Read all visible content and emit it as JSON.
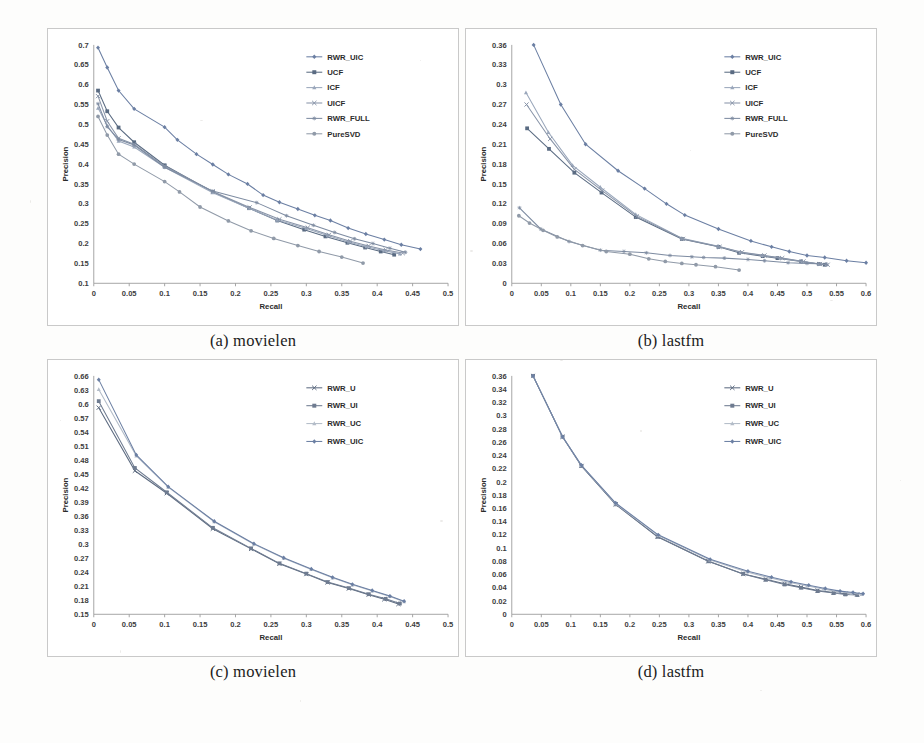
{
  "figure": {
    "panels": [
      {
        "id": "a",
        "caption": "(a) movielen",
        "chart_ref": 0
      },
      {
        "id": "b",
        "caption": "(b) lastfm",
        "chart_ref": 1
      },
      {
        "id": "c",
        "caption": "(c) movielen",
        "chart_ref": 2
      },
      {
        "id": "d",
        "caption": "(d) lastfm",
        "chart_ref": 3
      }
    ]
  },
  "colors": {
    "series_rwr_uic": "#6b7fa3",
    "series_ucf": "#5a6b82",
    "series_icf": "#9aa7bb",
    "series_uicf": "#8894a8",
    "series_rwr_full": "#7d8ba1",
    "series_puresvd": "#909aa8",
    "series_rwr_u": "#5d6b80",
    "series_rwr_ui": "#6e7b90",
    "series_rwr_uc": "#b3bcc8",
    "axis": "#9c9c9c",
    "text": "#2b2b2b",
    "panel_border": "#c9c9c9",
    "background": "#fdfdfc"
  },
  "chart_data": [
    {
      "type": "line",
      "title": "",
      "xlabel": "Recall",
      "ylabel": "Precision",
      "xlim": [
        0,
        0.5
      ],
      "ylim": [
        0.1,
        0.7
      ],
      "xticks": [
        "0",
        "0.05",
        "0.1",
        "0.15",
        "0.2",
        "0.25",
        "0.3",
        "0.35",
        "0.4",
        "0.45",
        "0.5"
      ],
      "yticks": [
        "0.1",
        "0.15",
        "0.2",
        "0.25",
        "0.3",
        "0.35",
        "0.4",
        "0.45",
        "0.5",
        "0.55",
        "0.6",
        "0.65",
        "0.7"
      ],
      "grid": false,
      "legend_position": "top-right",
      "series": [
        {
          "name": "RWR_UIC",
          "marker": "diamond",
          "color": "#6b7fa3",
          "x": [
            0.006,
            0.019,
            0.035,
            0.057,
            0.1,
            0.118,
            0.145,
            0.168,
            0.19,
            0.217,
            0.239,
            0.262,
            0.288,
            0.312,
            0.334,
            0.359,
            0.384,
            0.41,
            0.434,
            0.461
          ],
          "y": [
            0.693,
            0.643,
            0.585,
            0.539,
            0.493,
            0.461,
            0.425,
            0.399,
            0.374,
            0.35,
            0.322,
            0.304,
            0.287,
            0.271,
            0.258,
            0.239,
            0.224,
            0.21,
            0.197,
            0.186
          ]
        },
        {
          "name": "UCF",
          "marker": "square",
          "color": "#5a6b82",
          "x": [
            0.006,
            0.019,
            0.035,
            0.057,
            0.1,
            0.168,
            0.219,
            0.259,
            0.297,
            0.327,
            0.358,
            0.383,
            0.405,
            0.424
          ],
          "y": [
            0.585,
            0.533,
            0.492,
            0.455,
            0.397,
            0.33,
            0.289,
            0.258,
            0.235,
            0.218,
            0.202,
            0.19,
            0.18,
            0.172
          ]
        },
        {
          "name": "ICF",
          "marker": "triangle",
          "color": "#9aa7bb",
          "x": [
            0.006,
            0.019,
            0.035,
            0.057,
            0.1,
            0.168,
            0.219,
            0.259,
            0.3,
            0.33,
            0.36,
            0.385,
            0.41,
            0.432
          ],
          "y": [
            0.541,
            0.497,
            0.458,
            0.443,
            0.392,
            0.328,
            0.289,
            0.259,
            0.238,
            0.22,
            0.204,
            0.192,
            0.182,
            0.174
          ]
        },
        {
          "name": "UICF",
          "marker": "cross",
          "color": "#8894a8",
          "x": [
            0.006,
            0.019,
            0.035,
            0.057,
            0.1,
            0.168,
            0.22,
            0.262,
            0.302,
            0.332,
            0.362,
            0.388,
            0.412,
            0.436
          ],
          "y": [
            0.571,
            0.508,
            0.465,
            0.45,
            0.395,
            0.331,
            0.291,
            0.261,
            0.24,
            0.222,
            0.206,
            0.194,
            0.184,
            0.176
          ]
        },
        {
          "name": "RWR_FULL",
          "marker": "asterisk",
          "color": "#7d8ba1",
          "x": [
            0.006,
            0.019,
            0.035,
            0.057,
            0.1,
            0.168,
            0.23,
            0.272,
            0.31,
            0.34,
            0.368,
            0.394,
            0.418,
            0.44
          ],
          "y": [
            0.552,
            0.494,
            0.462,
            0.448,
            0.392,
            0.332,
            0.303,
            0.27,
            0.246,
            0.228,
            0.212,
            0.2,
            0.188,
            0.178
          ]
        },
        {
          "name": "PureSVD",
          "marker": "circle",
          "color": "#909aa8",
          "x": [
            0.006,
            0.019,
            0.035,
            0.057,
            0.1,
            0.121,
            0.15,
            0.19,
            0.222,
            0.254,
            0.288,
            0.318,
            0.35,
            0.38
          ],
          "y": [
            0.52,
            0.473,
            0.425,
            0.4,
            0.356,
            0.33,
            0.292,
            0.257,
            0.232,
            0.213,
            0.195,
            0.18,
            0.166,
            0.151
          ]
        }
      ]
    },
    {
      "type": "line",
      "title": "",
      "xlabel": "Recall",
      "ylabel": "Precision",
      "xlim": [
        0,
        0.6
      ],
      "ylim": [
        0,
        0.36
      ],
      "xticks": [
        "0",
        "0.05",
        "0.1",
        "0.15",
        "0.2",
        "0.25",
        "0.3",
        "0.35",
        "0.4",
        "0.45",
        "0.5",
        "0.55",
        "0.6"
      ],
      "yticks": [
        "0",
        "0.03",
        "0.06",
        "0.09",
        "0.12",
        "0.15",
        "0.18",
        "0.21",
        "0.24",
        "0.27",
        "0.3",
        "0.33",
        "0.36"
      ],
      "grid": false,
      "legend_position": "top-right",
      "series": [
        {
          "name": "RWR_UIC",
          "marker": "diamond",
          "color": "#6b7fa3",
          "x": [
            0.037,
            0.083,
            0.125,
            0.18,
            0.225,
            0.262,
            0.293,
            0.35,
            0.405,
            0.44,
            0.47,
            0.5,
            0.53,
            0.567,
            0.6
          ],
          "y": [
            0.36,
            0.27,
            0.21,
            0.17,
            0.143,
            0.12,
            0.103,
            0.082,
            0.064,
            0.055,
            0.048,
            0.042,
            0.039,
            0.034,
            0.031
          ]
        },
        {
          "name": "UCF",
          "marker": "square",
          "color": "#5a6b82",
          "x": [
            0.026,
            0.063,
            0.106,
            0.152,
            0.21,
            0.288,
            0.35,
            0.385,
            0.425,
            0.45,
            0.49,
            0.52,
            0.53
          ],
          "y": [
            0.234,
            0.203,
            0.167,
            0.137,
            0.1,
            0.067,
            0.055,
            0.046,
            0.041,
            0.038,
            0.033,
            0.029,
            0.028
          ]
        },
        {
          "name": "ICF",
          "marker": "triangle",
          "color": "#9aa7bb",
          "x": [
            0.024,
            0.062,
            0.103,
            0.15,
            0.21,
            0.288,
            0.35,
            0.387,
            0.425,
            0.455,
            0.492,
            0.52,
            0.533
          ],
          "y": [
            0.288,
            0.228,
            0.178,
            0.145,
            0.104,
            0.068,
            0.056,
            0.047,
            0.042,
            0.038,
            0.033,
            0.029,
            0.028
          ]
        },
        {
          "name": "UICF",
          "marker": "cross",
          "color": "#8894a8",
          "x": [
            0.025,
            0.065,
            0.106,
            0.153,
            0.212,
            0.29,
            0.352,
            0.39,
            0.428,
            0.458,
            0.494,
            0.522,
            0.535
          ],
          "y": [
            0.27,
            0.218,
            0.172,
            0.14,
            0.101,
            0.067,
            0.055,
            0.047,
            0.042,
            0.038,
            0.033,
            0.029,
            0.028
          ]
        },
        {
          "name": "RWR_FULL",
          "marker": "asterisk",
          "color": "#7d8ba1",
          "x": [
            0.013,
            0.049,
            0.097,
            0.15,
            0.19,
            0.228,
            0.268,
            0.305,
            0.325,
            0.36,
            0.4,
            0.428,
            0.468,
            0.5,
            0.533
          ],
          "y": [
            0.114,
            0.082,
            0.063,
            0.05,
            0.048,
            0.046,
            0.042,
            0.04,
            0.039,
            0.038,
            0.036,
            0.034,
            0.031,
            0.03,
            0.029
          ]
        },
        {
          "name": "PureSVD",
          "marker": "circle",
          "color": "#909aa8",
          "x": [
            0.012,
            0.03,
            0.053,
            0.077,
            0.12,
            0.16,
            0.2,
            0.232,
            0.26,
            0.288,
            0.312,
            0.345,
            0.385
          ],
          "y": [
            0.102,
            0.091,
            0.08,
            0.07,
            0.057,
            0.048,
            0.044,
            0.037,
            0.033,
            0.03,
            0.028,
            0.025,
            0.02
          ]
        }
      ]
    },
    {
      "type": "line",
      "title": "",
      "xlabel": "Recall",
      "ylabel": "Precision",
      "xlim": [
        0,
        0.5
      ],
      "ylim": [
        0.15,
        0.66
      ],
      "xticks": [
        "0",
        "0.05",
        "0.1",
        "0.15",
        "0.2",
        "0.25",
        "0.3",
        "0.35",
        "0.4",
        "0.45",
        "0.5"
      ],
      "yticks": [
        "0.15",
        "0.18",
        "0.21",
        "0.24",
        "0.27",
        "0.3",
        "0.33",
        "0.36",
        "0.39",
        "0.42",
        "0.45",
        "0.48",
        "0.51",
        "0.54",
        "0.57",
        "0.6",
        "0.63",
        "0.66"
      ],
      "grid": false,
      "legend_position": "top-right",
      "series": [
        {
          "name": "RWR_U",
          "marker": "cross",
          "color": "#5d6b80",
          "x": [
            0.007,
            0.058,
            0.103,
            0.168,
            0.222,
            0.262,
            0.3,
            0.33,
            0.36,
            0.388,
            0.41,
            0.43
          ],
          "y": [
            0.592,
            0.457,
            0.409,
            0.333,
            0.29,
            0.258,
            0.236,
            0.218,
            0.205,
            0.192,
            0.182,
            0.172
          ]
        },
        {
          "name": "RWR_UI",
          "marker": "square",
          "color": "#6e7b90",
          "x": [
            0.007,
            0.058,
            0.103,
            0.168,
            0.222,
            0.262,
            0.3,
            0.33,
            0.36,
            0.388,
            0.412,
            0.432
          ],
          "y": [
            0.606,
            0.463,
            0.411,
            0.335,
            0.291,
            0.259,
            0.237,
            0.219,
            0.206,
            0.193,
            0.183,
            0.173
          ]
        },
        {
          "name": "RWR_UC",
          "marker": "triangle",
          "color": "#b3bcc8",
          "x": [
            0.007,
            0.06,
            0.105,
            0.17,
            0.226,
            0.268,
            0.307,
            0.337,
            0.365,
            0.393,
            0.418,
            0.438
          ],
          "y": [
            0.631,
            0.489,
            0.422,
            0.348,
            0.3,
            0.27,
            0.246,
            0.228,
            0.213,
            0.2,
            0.188,
            0.177
          ]
        },
        {
          "name": "RWR_UIC",
          "marker": "diamond",
          "color": "#6b7fa3",
          "x": [
            0.007,
            0.06,
            0.105,
            0.17,
            0.226,
            0.268,
            0.307,
            0.337,
            0.365,
            0.393,
            0.418,
            0.438
          ],
          "y": [
            0.652,
            0.491,
            0.423,
            0.349,
            0.301,
            0.271,
            0.247,
            0.229,
            0.214,
            0.201,
            0.189,
            0.178
          ]
        }
      ]
    },
    {
      "type": "line",
      "title": "",
      "xlabel": "Recall",
      "ylabel": "Precision",
      "xlim": [
        0,
        0.6
      ],
      "ylim": [
        0,
        0.36
      ],
      "xticks": [
        "0",
        "0.05",
        "0.1",
        "0.15",
        "0.2",
        "0.25",
        "0.3",
        "0.35",
        "0.4",
        "0.45",
        "0.5",
        "0.55",
        "0.6"
      ],
      "yticks": [
        "0",
        "0.02",
        "0.04",
        "0.06",
        "0.08",
        "0.1",
        "0.12",
        "0.14",
        "0.16",
        "0.18",
        "0.2",
        "0.22",
        "0.24",
        "0.26",
        "0.28",
        "0.3",
        "0.32",
        "0.34",
        "0.36"
      ],
      "grid": false,
      "legend_position": "top-right",
      "series": [
        {
          "name": "RWR_U",
          "marker": "cross",
          "color": "#5d6b80",
          "x": [
            0.036,
            0.086,
            0.118,
            0.176,
            0.247,
            0.333,
            0.392,
            0.43,
            0.462,
            0.49,
            0.518,
            0.545,
            0.565,
            0.585
          ],
          "y": [
            0.36,
            0.268,
            0.224,
            0.166,
            0.117,
            0.08,
            0.061,
            0.053,
            0.046,
            0.041,
            0.036,
            0.033,
            0.031,
            0.03
          ]
        },
        {
          "name": "RWR_UI",
          "marker": "square",
          "color": "#6e7b90",
          "x": [
            0.036,
            0.086,
            0.118,
            0.176,
            0.247,
            0.333,
            0.392,
            0.43,
            0.462,
            0.49,
            0.518,
            0.545,
            0.565,
            0.585
          ],
          "y": [
            0.36,
            0.268,
            0.224,
            0.166,
            0.117,
            0.08,
            0.061,
            0.052,
            0.045,
            0.04,
            0.035,
            0.032,
            0.03,
            0.029
          ]
        },
        {
          "name": "RWR_UC",
          "marker": "triangle",
          "color": "#b3bcc8",
          "x": [
            0.036,
            0.086,
            0.118,
            0.176,
            0.248,
            0.336,
            0.398,
            0.437,
            0.47,
            0.5,
            0.528,
            0.552,
            0.575,
            0.592
          ],
          "y": [
            0.36,
            0.268,
            0.225,
            0.167,
            0.119,
            0.082,
            0.064,
            0.055,
            0.048,
            0.043,
            0.038,
            0.034,
            0.032,
            0.03
          ]
        },
        {
          "name": "RWR_UIC",
          "marker": "diamond",
          "color": "#6b7fa3",
          "x": [
            0.036,
            0.086,
            0.118,
            0.176,
            0.248,
            0.336,
            0.4,
            0.44,
            0.473,
            0.503,
            0.531,
            0.556,
            0.578,
            0.595
          ],
          "y": [
            0.36,
            0.268,
            0.225,
            0.168,
            0.12,
            0.083,
            0.065,
            0.056,
            0.049,
            0.044,
            0.039,
            0.035,
            0.033,
            0.031
          ]
        }
      ]
    }
  ]
}
